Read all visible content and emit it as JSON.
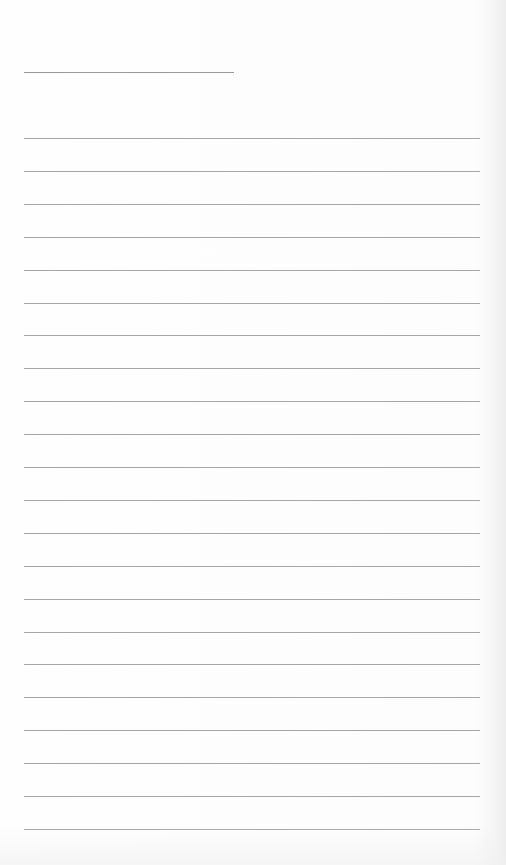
{
  "page": {
    "type": "blank lined paper",
    "title_line": {
      "x": 24,
      "y": 72,
      "width": 210,
      "color": "#9a9a9a"
    },
    "rules": {
      "count": 22,
      "x": 24,
      "width": 456,
      "first_y": 138,
      "spacing": 32.9,
      "color": "#a6a6a6"
    },
    "background_color": "#fdfdfd",
    "text": ""
  }
}
